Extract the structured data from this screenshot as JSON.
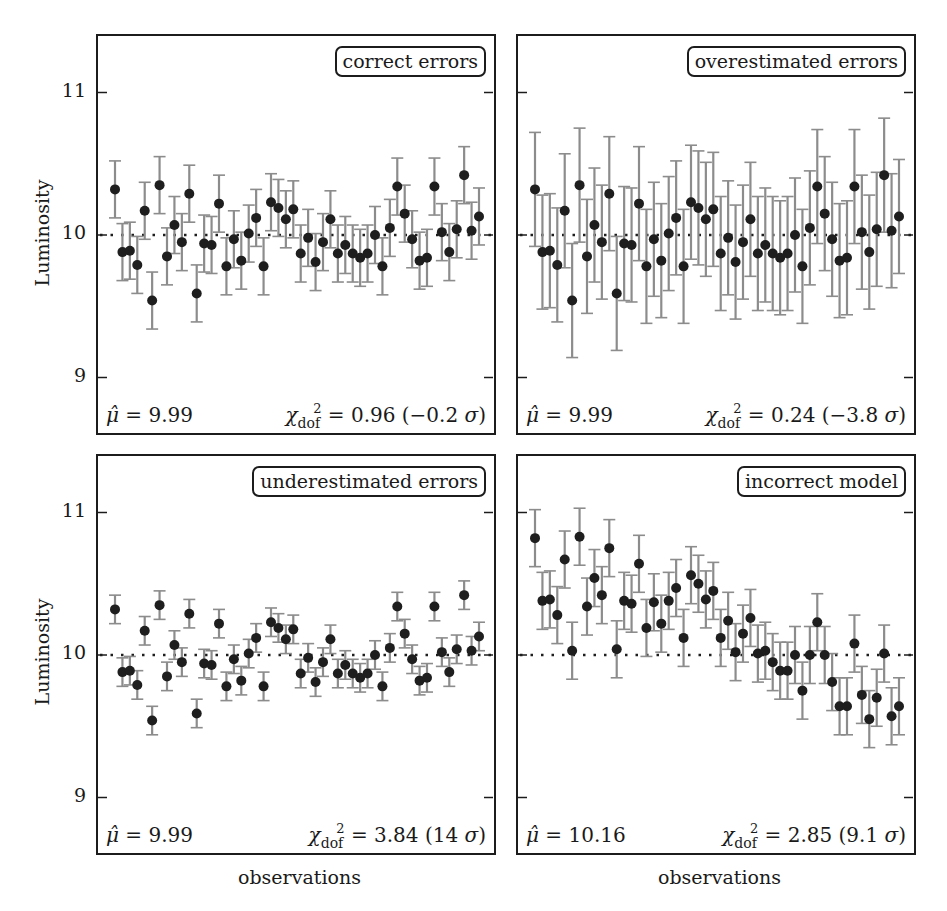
{
  "chart_data": [
    {
      "type": "scatter",
      "subtype": "errorbar",
      "title": "correct errors",
      "xlabel": "",
      "ylabel": "Luminosity",
      "ylim": [
        8.65,
        11.3
      ],
      "yticks": [
        9,
        10,
        11
      ],
      "reference_line": {
        "y": 10,
        "style": "dotted"
      },
      "error": 0.2,
      "values_note": "Point values estimated visually from zoomed crops (~±0.02); error bar size assumed uniform per panel, not measured per point.",
      "values": [
        10.32,
        9.88,
        9.89,
        9.79,
        10.17,
        9.54,
        10.35,
        9.85,
        10.07,
        9.95,
        10.29,
        9.59,
        9.94,
        9.93,
        10.22,
        9.78,
        9.97,
        9.82,
        10.01,
        10.12,
        9.78,
        10.23,
        10.19,
        10.11,
        10.18,
        9.87,
        9.98,
        9.81,
        9.95,
        10.11,
        9.87,
        9.93,
        9.87,
        9.84,
        9.87,
        10.0,
        9.78,
        10.05,
        10.34,
        10.15,
        9.97,
        9.82,
        9.84,
        10.34,
        10.02,
        9.88,
        10.04,
        10.42,
        10.03,
        10.13
      ],
      "annotations": {
        "mu_hat": "9.99",
        "chi2_dof": "0.96",
        "sigma": "−0.2"
      }
    },
    {
      "type": "scatter",
      "subtype": "errorbar",
      "title": "overestimated errors",
      "ylim": [
        8.65,
        11.3
      ],
      "yticks": [
        9,
        10,
        11
      ],
      "reference_line": {
        "y": 10,
        "style": "dotted"
      },
      "error": 0.4,
      "values_note": "Same underlying points as 'correct errors' (visually verified); error bar size assumed uniform, not measured per point.",
      "values": [
        10.32,
        9.88,
        9.89,
        9.79,
        10.17,
        9.54,
        10.35,
        9.85,
        10.07,
        9.95,
        10.29,
        9.59,
        9.94,
        9.93,
        10.22,
        9.78,
        9.97,
        9.82,
        10.01,
        10.12,
        9.78,
        10.23,
        10.19,
        10.11,
        10.18,
        9.87,
        9.98,
        9.81,
        9.95,
        10.11,
        9.87,
        9.93,
        9.87,
        9.84,
        9.87,
        10.0,
        9.78,
        10.05,
        10.34,
        10.15,
        9.97,
        9.82,
        9.84,
        10.34,
        10.02,
        9.88,
        10.04,
        10.42,
        10.03,
        10.13
      ],
      "annotations": {
        "mu_hat": "9.99",
        "chi2_dof": "0.24",
        "sigma": "−3.8"
      }
    },
    {
      "type": "scatter",
      "subtype": "errorbar",
      "title": "underestimated errors",
      "xlabel": "observations",
      "ylabel": "Luminosity",
      "ylim": [
        8.65,
        11.3
      ],
      "yticks": [
        9,
        10,
        11
      ],
      "reference_line": {
        "y": 10,
        "style": "dotted"
      },
      "error": 0.1,
      "values_note": "Same underlying points as 'correct errors' (visually verified); error bar size assumed uniform, not measured per point.",
      "values": [
        10.32,
        9.88,
        9.89,
        9.79,
        10.17,
        9.54,
        10.35,
        9.85,
        10.07,
        9.95,
        10.29,
        9.59,
        9.94,
        9.93,
        10.22,
        9.78,
        9.97,
        9.82,
        10.01,
        10.12,
        9.78,
        10.23,
        10.19,
        10.11,
        10.18,
        9.87,
        9.98,
        9.81,
        9.95,
        10.11,
        9.87,
        9.93,
        9.87,
        9.84,
        9.87,
        10.0,
        9.78,
        10.05,
        10.34,
        10.15,
        9.97,
        9.82,
        9.84,
        10.34,
        10.02,
        9.88,
        10.04,
        10.42,
        10.03,
        10.13
      ],
      "annotations": {
        "mu_hat": "9.99",
        "chi2_dof": "3.84",
        "sigma": "14"
      }
    },
    {
      "type": "scatter",
      "subtype": "errorbar",
      "title": "incorrect model",
      "xlabel": "observations",
      "ylim": [
        8.65,
        11.3
      ],
      "yticks": [
        9,
        10,
        11
      ],
      "reference_line": {
        "y": 10,
        "style": "dotted"
      },
      "error": 0.2,
      "values_note": "Estimated, not independently read: approximated as the 'correct errors' noise plus a linear trend (~+0.5 to ~−0.5), checked against sampled points. Error bar size assumed uniform.",
      "values": [
        10.82,
        10.38,
        10.39,
        10.28,
        10.67,
        10.03,
        10.83,
        10.34,
        10.54,
        10.42,
        10.75,
        10.04,
        10.38,
        10.36,
        10.64,
        10.19,
        10.37,
        10.22,
        10.38,
        10.47,
        10.12,
        10.56,
        10.5,
        10.39,
        10.45,
        10.12,
        10.24,
        10.02,
        10.15,
        10.26,
        10.01,
        10.03,
        9.95,
        9.89,
        9.89,
        10.0,
        9.75,
        10.0,
        10.23,
        10.0,
        9.81,
        9.64,
        9.64,
        10.08,
        9.72,
        9.55,
        9.7,
        10.01,
        9.57,
        9.64
      ],
      "annotations": {
        "mu_hat": "10.16",
        "chi2_dof": "2.85",
        "sigma": "9.1"
      }
    }
  ],
  "labels": {
    "ylabel": "Luminosity",
    "xlabel": "observations",
    "yticks": [
      "11",
      "10",
      "9"
    ]
  },
  "panels": [
    {
      "legend": "correct errors",
      "mu_text": "= 9.99",
      "chi_text": "= 0.96 (−0.2 ",
      "sigma_close": ")"
    },
    {
      "legend": "overestimated errors",
      "mu_text": "= 9.99",
      "chi_text": "= 0.24 (−3.8 ",
      "sigma_close": ")"
    },
    {
      "legend": "underestimated errors",
      "mu_text": "= 9.99",
      "chi_text": "= 3.84 (14 ",
      "sigma_close": ")"
    },
    {
      "legend": "incorrect model",
      "mu_text": "= 10.16",
      "chi_text": "= 2.85 (9.1 ",
      "sigma_close": ")"
    }
  ],
  "colors": {
    "point": "#1e1e1e",
    "errorbar": "#8c8c8c",
    "frame": "#1c1c1c",
    "refline": "#1e1e1e"
  }
}
